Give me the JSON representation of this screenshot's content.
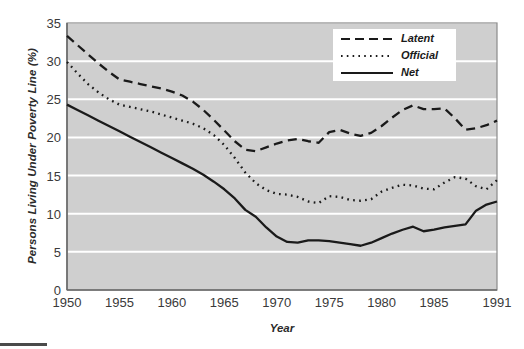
{
  "chart_data": {
    "type": "line",
    "title": "",
    "xlabel": "Year",
    "ylabel": "Persons Living Under Poverty Line (%)",
    "xlim": [
      1950,
      1991
    ],
    "ylim": [
      0,
      35
    ],
    "yticks": [
      0,
      5,
      10,
      15,
      20,
      25,
      30,
      35
    ],
    "xticks": [
      1950,
      1955,
      1960,
      1965,
      1970,
      1975,
      1980,
      1985,
      1991
    ],
    "xtick_labels": [
      "1950",
      "1955",
      "1960",
      "1965",
      "1970",
      "1975",
      "1980",
      "1985",
      "1991"
    ],
    "ytick_labels": [
      "0",
      "5",
      "10",
      "15",
      "20",
      "25",
      "30",
      "35"
    ],
    "grid": "horizontal-white",
    "plot_background": "#cfcfcf",
    "legend_position": "top-right",
    "x": [
      1950,
      1951,
      1952,
      1953,
      1954,
      1955,
      1956,
      1957,
      1958,
      1959,
      1960,
      1961,
      1962,
      1963,
      1964,
      1965,
      1966,
      1967,
      1968,
      1969,
      1970,
      1971,
      1972,
      1973,
      1974,
      1975,
      1976,
      1977,
      1978,
      1979,
      1980,
      1981,
      1982,
      1983,
      1984,
      1985,
      1986,
      1987,
      1988,
      1989,
      1990,
      1991
    ],
    "series": [
      {
        "name": "Latent",
        "style": "dashed",
        "color": "#1a1a1a",
        "values": [
          33.3,
          32.1,
          30.9,
          29.7,
          28.6,
          27.6,
          27.3,
          27.0,
          26.7,
          26.4,
          26.0,
          25.5,
          24.7,
          23.6,
          22.3,
          20.9,
          19.5,
          18.4,
          18.2,
          18.7,
          19.2,
          19.6,
          19.8,
          19.5,
          19.3,
          20.7,
          21.0,
          20.5,
          20.2,
          20.6,
          21.5,
          22.6,
          23.6,
          24.2,
          23.7,
          23.7,
          23.8,
          22.5,
          21.0,
          21.2,
          21.6,
          22.2
        ]
      },
      {
        "name": "Official",
        "style": "dotted",
        "color": "#1a1a1a",
        "values": [
          29.9,
          28.4,
          27.0,
          25.9,
          25.0,
          24.3,
          24.0,
          23.7,
          23.4,
          23.0,
          22.6,
          22.2,
          21.8,
          21.2,
          20.3,
          19.0,
          17.3,
          15.4,
          14.0,
          13.1,
          12.6,
          12.5,
          12.2,
          11.6,
          11.4,
          12.3,
          12.2,
          11.8,
          11.7,
          11.9,
          12.9,
          13.4,
          13.8,
          13.7,
          13.3,
          13.2,
          14.1,
          14.8,
          14.6,
          13.6,
          13.2,
          14.4
        ]
      },
      {
        "name": "Net",
        "style": "solid",
        "color": "#1a1a1a",
        "values": [
          24.3,
          23.6,
          22.9,
          22.2,
          21.5,
          20.8,
          20.1,
          19.4,
          18.7,
          18.0,
          17.3,
          16.6,
          15.9,
          15.1,
          14.2,
          13.2,
          12.0,
          10.5,
          9.6,
          8.2,
          7.0,
          6.3,
          6.2,
          6.5,
          6.5,
          6.4,
          6.2,
          6.0,
          5.8,
          6.2,
          6.8,
          7.4,
          7.9,
          8.3,
          7.7,
          7.9,
          8.2,
          8.4,
          8.6,
          10.4,
          11.2,
          11.6
        ]
      }
    ]
  },
  "legend": {
    "items": [
      {
        "label": "Latent",
        "style": "dashed"
      },
      {
        "label": "Official",
        "style": "dotted"
      },
      {
        "label": "Net",
        "style": "solid"
      }
    ]
  }
}
